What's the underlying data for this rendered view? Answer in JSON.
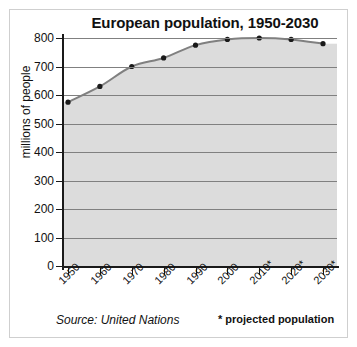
{
  "chart_data": {
    "type": "area",
    "title": "European population, 1950-2030",
    "xlabel": "",
    "ylabel": "millions of people",
    "categories": [
      "1950",
      "1960",
      "1970",
      "1980",
      "1990",
      "2000",
      "2010*",
      "2020*",
      "2030*"
    ],
    "values": [
      575,
      630,
      700,
      730,
      775,
      795,
      800,
      795,
      780
    ],
    "ylim": [
      0,
      800
    ],
    "yticks": [
      0,
      100,
      200,
      300,
      400,
      500,
      600,
      700,
      800
    ],
    "ytick_labels": [
      "0",
      "100",
      "200",
      "300",
      "400",
      "500",
      "600",
      "700",
      "800"
    ],
    "grid": true,
    "legend": "none",
    "series": [
      {
        "name": "European population",
        "values": [
          575,
          630,
          700,
          730,
          775,
          795,
          800,
          795,
          780
        ]
      }
    ],
    "colors": {
      "plot_background": "#dcdcdc",
      "gridline": "#808080",
      "line": "#808080",
      "marker": "#1a1a1a",
      "axis": "#1a1a1a",
      "text": "#111111",
      "frame": "#cfcfcf",
      "page_background": "#ffffff"
    },
    "notes": {
      "source": "Source: United Nations",
      "projection": "* projected population"
    }
  }
}
